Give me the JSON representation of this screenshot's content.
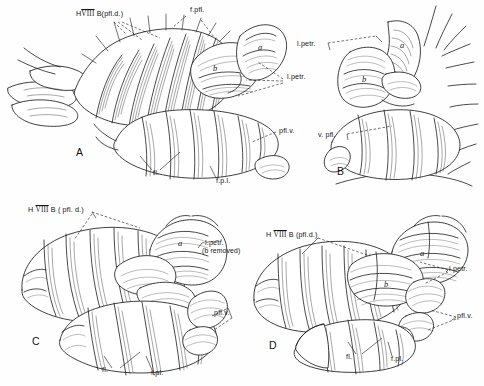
{
  "plate": {
    "title": "Cerebellar flocculus and paraflocculus, four views",
    "background_color": "#fefefe",
    "ink_color": "#1a1a1a",
    "width": 484,
    "height": 386
  },
  "panels": [
    {
      "id": "A",
      "letter": "A",
      "letter_pos": {
        "x": 76,
        "y": 146
      },
      "labels": [
        {
          "name": "hviii-b-pfl-d",
          "text_pre": "H",
          "roman": "VIII",
          "text_post": " B(pfl.d.)",
          "x": 76,
          "y": 14,
          "leaders": 3
        },
        {
          "name": "f-pfl",
          "text": "f.pfl.",
          "x": 188,
          "y": 10,
          "leaders": 1
        },
        {
          "name": "l-petr",
          "text": "l.petr.",
          "x": 286,
          "y": 76,
          "leaders": 3
        },
        {
          "name": "pfl-v",
          "text": "pfl.v.",
          "x": 278,
          "y": 130,
          "leaders": 1
        },
        {
          "name": "fl",
          "text": "fl.",
          "x": 154,
          "y": 172,
          "leaders": 2
        },
        {
          "name": "f-p-l",
          "text": "f.p.l.",
          "x": 218,
          "y": 180,
          "leaders": 1
        }
      ],
      "lobes": [
        {
          "name": "lobe-a",
          "text": "a",
          "x": 258,
          "y": 48
        },
        {
          "name": "lobe-b",
          "text": "b",
          "x": 214,
          "y": 68
        }
      ]
    },
    {
      "id": "B",
      "letter": "B",
      "letter_pos": {
        "x": 338,
        "y": 166
      },
      "labels": [
        {
          "name": "l-petr",
          "text": "l.petr.",
          "x": 297,
          "y": 44,
          "leaders": 1
        },
        {
          "name": "v-pfl",
          "text": "v. pfl.",
          "x": 319,
          "y": 135,
          "leaders": 1
        }
      ],
      "lobes": [
        {
          "name": "lobe-a",
          "text": "a",
          "x": 402,
          "y": 45
        },
        {
          "name": "lobe-b",
          "text": "b",
          "x": 373,
          "y": 77
        }
      ]
    },
    {
      "id": "C",
      "letter": "C",
      "letter_pos": {
        "x": 33,
        "y": 336
      },
      "labels": [
        {
          "name": "h-viii-b-pfl-d",
          "text_pre": "H ",
          "roman": "VIII",
          "text_post": " B ( pfl. d.)",
          "x": 30,
          "y": 210,
          "leaders": 2
        },
        {
          "name": "l-petr",
          "text": "l.petr.",
          "x": 206,
          "y": 243,
          "leaders": 1
        },
        {
          "name": "b-removed",
          "text": "(b removed)",
          "x": 203,
          "y": 251,
          "leaders": 0
        },
        {
          "name": "pfl-v",
          "text": "pfl.v.",
          "x": 215,
          "y": 313,
          "leaders": 1
        },
        {
          "name": "fl",
          "text": "fl.",
          "x": 103,
          "y": 370,
          "leaders": 2
        },
        {
          "name": "f-pl",
          "text": "f.pl.",
          "x": 152,
          "y": 373,
          "leaders": 1
        }
      ],
      "lobes": [
        {
          "name": "lobe-a",
          "text": "a",
          "x": 178,
          "y": 243
        }
      ]
    },
    {
      "id": "D",
      "letter": "D",
      "letter_pos": {
        "x": 270,
        "y": 340
      },
      "labels": [
        {
          "name": "h-viii-b-pfl-d",
          "text_pre": "H ",
          "roman": "VIII",
          "text_post": " B (pfl.d.)",
          "x": 268,
          "y": 235,
          "leaders": 1
        },
        {
          "name": "l-petr",
          "text": "l.petr.",
          "x": 450,
          "y": 269,
          "leaders": 2
        },
        {
          "name": "pfl-v",
          "text": "pfl.v.",
          "x": 458,
          "y": 316,
          "leaders": 1
        },
        {
          "name": "fl",
          "text": "fl.",
          "x": 347,
          "y": 357,
          "leaders": 2
        },
        {
          "name": "f-pl",
          "text": "f.pl.",
          "x": 392,
          "y": 359,
          "leaders": 1
        }
      ],
      "lobes": [
        {
          "name": "lobe-a",
          "text": "a",
          "x": 421,
          "y": 253
        },
        {
          "name": "lobe-b",
          "text": "b",
          "x": 385,
          "y": 283
        }
      ]
    }
  ]
}
